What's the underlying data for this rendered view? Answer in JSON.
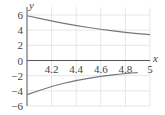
{
  "chart_data": {
    "type": "line",
    "title": "",
    "xlabel": "x",
    "ylabel": "y",
    "xlim": [
      4,
      5
    ],
    "ylim": [
      -6,
      6
    ],
    "grid": true,
    "x_ticks": [
      "4.2",
      "4.4",
      "4.6",
      "4.8",
      "5"
    ],
    "y_ticks": [
      "6",
      "4",
      "2",
      "0",
      "−2",
      "−4",
      "−6"
    ],
    "series": [
      {
        "name": "upper curve",
        "x": [
          4.0,
          4.2,
          4.4,
          4.6,
          4.8,
          5.0
        ],
        "values": [
          5.9,
          5.2,
          4.6,
          4.1,
          3.7,
          3.4
        ]
      },
      {
        "name": "lower curve",
        "x": [
          4.0,
          4.2,
          4.4,
          4.6,
          4.8,
          4.9
        ],
        "values": [
          -4.5,
          -3.4,
          -2.6,
          -2.1,
          -1.7,
          -1.6
        ]
      }
    ]
  }
}
